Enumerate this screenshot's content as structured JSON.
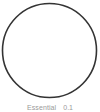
{
  "figure": {
    "background_color": "#ffffff",
    "shape": {
      "icon_name": "circle-outline-icon",
      "type": "circle",
      "stroke_color": "#333333",
      "fill_color": "#ffffff",
      "stroke_width": 1.6,
      "center_x": 49.5,
      "center_y": 50.5,
      "radius": 47
    },
    "caption": {
      "label": "Essential",
      "value": "0.1"
    }
  }
}
